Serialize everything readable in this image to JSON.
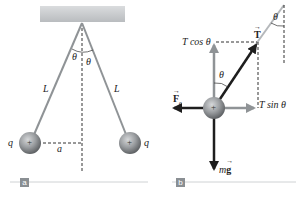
{
  "panels": {
    "a": {
      "tag": "a",
      "labels": {
        "theta_left": "θ",
        "theta_right": "θ",
        "length_left": "L",
        "length_right": "L",
        "charge_left": "q",
        "charge_right": "q",
        "half_separation": "a",
        "ball_sign_left": "+",
        "ball_sign_right": "+"
      }
    },
    "b": {
      "tag": "b",
      "labels": {
        "tension": "T",
        "tension_vertical": "T cos θ",
        "tension_horizontal": "T sin θ",
        "electric_force": "F",
        "electric_force_sub": "e",
        "weight_m": "m",
        "weight_g": "g",
        "theta_body": "θ",
        "theta_top": "θ",
        "ball_sign": "+"
      }
    }
  },
  "colors": {
    "ceiling": "#c9cccf",
    "string": "#8f9396",
    "ball": "#8c8f92",
    "dark_arrow": "#1e1e1e",
    "component_arrow": "#8f9396",
    "panel_tag": "#8a8f93",
    "baseline": "#cfd2d4"
  }
}
